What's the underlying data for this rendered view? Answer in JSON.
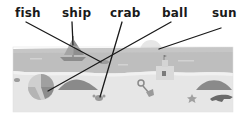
{
  "exercise": {
    "labels": [
      {
        "id": "fish",
        "text": "fish",
        "x": 15
      },
      {
        "id": "ship",
        "text": "ship",
        "x": 62
      },
      {
        "id": "crab",
        "text": "crab",
        "x": 110
      },
      {
        "id": "ball",
        "text": "ball",
        "x": 162
      },
      {
        "id": "sun",
        "text": "sun",
        "x": 212
      }
    ],
    "connections": [
      {
        "word": "fish",
        "from": [
          26,
          22
        ],
        "to": [
          101,
          62
        ]
      },
      {
        "word": "ship",
        "from": [
          72,
          22
        ],
        "to": [
          73,
          45
        ]
      },
      {
        "word": "crab",
        "from": [
          122,
          22
        ],
        "to": [
          100,
          97
        ]
      },
      {
        "word": "ball",
        "from": [
          171,
          22
        ],
        "to": [
          48,
          91
        ]
      },
      {
        "word": "sun",
        "from": [
          221,
          28
        ],
        "to": [
          159,
          49
        ]
      }
    ]
  },
  "colors": {
    "sky": "#ffffff",
    "sea": "#bdbdbd",
    "sea_light": "#d0d0d0",
    "sand": "#e6e6e6",
    "mound": "#8a8a8a",
    "sun": "#e9e9e9",
    "line": "#1a1a1a"
  }
}
